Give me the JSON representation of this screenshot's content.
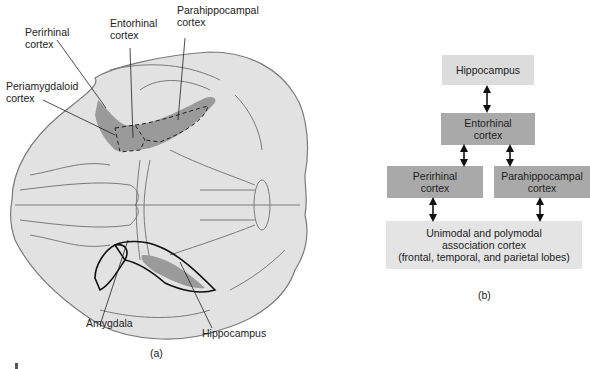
{
  "panel_a": {
    "labels": {
      "perirhinal": "Perirhinal\ncortex",
      "perirhinal_l1": "Perirhinal",
      "perirhinal_l2": "cortex",
      "entorhinal_l1": "Entorhinal",
      "entorhinal_l2": "cortex",
      "parahippocampal_l1": "Parahippocampal",
      "parahippocampal_l2": "cortex",
      "periamygdaloid_l1": "Periamygdaloid",
      "periamygdaloid_l2": "cortex",
      "amygdala": "Amygdala",
      "hippocampus": "Hippocampus"
    },
    "caption": "(a)"
  },
  "panel_b": {
    "boxes": {
      "hippocampus": "Hippocampus",
      "entorhinal_l1": "Entorhinal",
      "entorhinal_l2": "cortex",
      "perirhinal_l1": "Perirhinal",
      "perirhinal_l2": "cortex",
      "parahippocampal_l1": "Parahippocampal",
      "parahippocampal_l2": "cortex",
      "association_l1": "Unimodal and polymodal",
      "association_l2": "association cortex",
      "association_l3": "(frontal, temporal, and parietal lobes)"
    },
    "caption": "(b)",
    "colors": {
      "light_box": "#dcdcdc",
      "dark_box": "#a9a9a9",
      "pale_box": "#e4e4e4"
    }
  },
  "colors": {
    "brain_fill": "#e2e2e2",
    "brain_outline": "#7a7a7a",
    "highlight_region": "#9a9a9a"
  }
}
